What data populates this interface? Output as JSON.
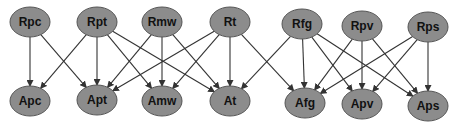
{
  "diagram": {
    "type": "bipartite-directed-graph",
    "colors": {
      "node_fill": "#8c8c8c",
      "node_stroke": "#555555",
      "edge": "#333333",
      "label": "#111111",
      "background": "#ffffff"
    },
    "nodes": [
      {
        "id": "Rpc",
        "label": "Rpc",
        "row": "top",
        "cx": 30,
        "cy": 22
      },
      {
        "id": "Rpt",
        "label": "Rpt",
        "row": "top",
        "cx": 97,
        "cy": 22
      },
      {
        "id": "Rmw",
        "label": "Rmw",
        "row": "top",
        "cx": 162,
        "cy": 22
      },
      {
        "id": "Rt",
        "label": "Rt",
        "row": "top",
        "cx": 230,
        "cy": 22
      },
      {
        "id": "Rfg",
        "label": "Rfg",
        "row": "top",
        "cx": 302,
        "cy": 24
      },
      {
        "id": "Rpv",
        "label": "Rpv",
        "row": "top",
        "cx": 362,
        "cy": 26
      },
      {
        "id": "Rps",
        "label": "Rps",
        "row": "top",
        "cx": 428,
        "cy": 27
      },
      {
        "id": "Apc",
        "label": "Apc",
        "row": "bottom",
        "cx": 30,
        "cy": 101
      },
      {
        "id": "Apt",
        "label": "Apt",
        "row": "bottom",
        "cx": 97,
        "cy": 100
      },
      {
        "id": "Amw",
        "label": "Amw",
        "row": "bottom",
        "cx": 162,
        "cy": 101
      },
      {
        "id": "At",
        "label": "At",
        "row": "bottom",
        "cx": 230,
        "cy": 101
      },
      {
        "id": "Afg",
        "label": "Afg",
        "row": "bottom",
        "cx": 305,
        "cy": 103
      },
      {
        "id": "Apv",
        "label": "Apv",
        "row": "bottom",
        "cx": 362,
        "cy": 104
      },
      {
        "id": "Aps",
        "label": "Aps",
        "row": "bottom",
        "cx": 428,
        "cy": 106
      }
    ],
    "edges": [
      {
        "from": "Rpc",
        "to": "Apc"
      },
      {
        "from": "Rpc",
        "to": "Apt"
      },
      {
        "from": "Rpt",
        "to": "Apc"
      },
      {
        "from": "Rpt",
        "to": "Apt"
      },
      {
        "from": "Rpt",
        "to": "Amw"
      },
      {
        "from": "Rpt",
        "to": "At"
      },
      {
        "from": "Rmw",
        "to": "Apt"
      },
      {
        "from": "Rmw",
        "to": "Amw"
      },
      {
        "from": "Rmw",
        "to": "At"
      },
      {
        "from": "Rt",
        "to": "Apt"
      },
      {
        "from": "Rt",
        "to": "Amw"
      },
      {
        "from": "Rt",
        "to": "At"
      },
      {
        "from": "Rt",
        "to": "Afg"
      },
      {
        "from": "Rfg",
        "to": "At"
      },
      {
        "from": "Rfg",
        "to": "Afg"
      },
      {
        "from": "Rfg",
        "to": "Apv"
      },
      {
        "from": "Rfg",
        "to": "Aps"
      },
      {
        "from": "Rpv",
        "to": "Afg"
      },
      {
        "from": "Rpv",
        "to": "Apv"
      },
      {
        "from": "Rpv",
        "to": "Aps"
      },
      {
        "from": "Rps",
        "to": "Afg"
      },
      {
        "from": "Rps",
        "to": "Apv"
      },
      {
        "from": "Rps",
        "to": "Aps"
      }
    ]
  }
}
